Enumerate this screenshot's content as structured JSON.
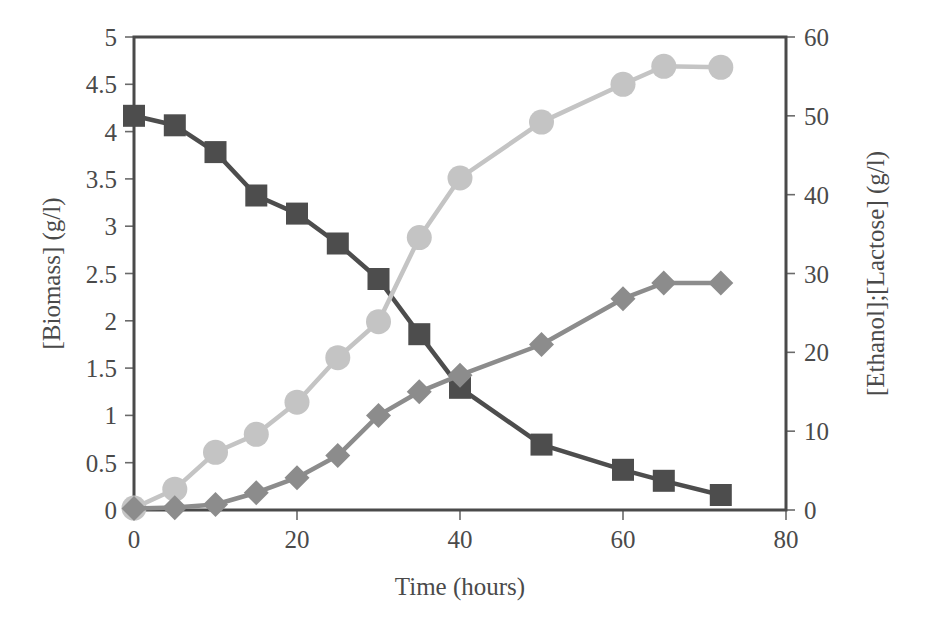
{
  "chart_data": {
    "type": "line",
    "title": "",
    "subtitle": "",
    "xlabel": "Time (hours)",
    "ylabel": "[Biomass] (g/l)",
    "y2label": "[Ethanol];[Lactose] (g/l)",
    "xlim": [
      0,
      80
    ],
    "xticks": [
      0,
      20,
      40,
      60,
      80
    ],
    "xticklabels": [
      "0",
      "20",
      "40",
      "60",
      "80"
    ],
    "ylim": [
      0,
      5
    ],
    "yticks": [
      0,
      0.5,
      1,
      1.5,
      2,
      2.5,
      3,
      3.5,
      4,
      4.5,
      5
    ],
    "yticklabels": [
      "0",
      "0.5",
      "1",
      "1.5",
      "2",
      "2.5",
      "3",
      "3.5",
      "4",
      "4.5",
      "5"
    ],
    "y2lim": [
      0,
      60
    ],
    "y2ticks": [
      0,
      10,
      20,
      30,
      40,
      50,
      60
    ],
    "y2ticklabels": [
      "0",
      "10",
      "20",
      "30",
      "40",
      "50",
      "60"
    ],
    "grid": false,
    "legend": "none",
    "x": [
      0,
      5,
      10,
      15,
      20,
      25,
      30,
      35,
      40,
      50,
      60,
      65,
      72
    ],
    "series": [
      {
        "name": "Lactose",
        "marker": "square",
        "color": "#4d4d4d",
        "axis": "right",
        "units": "g/l",
        "values": [
          50.0,
          48.8,
          45.4,
          39.9,
          37.6,
          33.8,
          29.3,
          22.3,
          15.5,
          8.3,
          5.1,
          3.7,
          1.9
        ],
        "values_left_scale": [
          4.18,
          4.07,
          3.78,
          3.33,
          3.13,
          2.82,
          2.44,
          1.86,
          1.29,
          0.69,
          0.43,
          0.31,
          0.16
        ]
      },
      {
        "name": "Biomass",
        "marker": "circle",
        "color": "#c4c4c4",
        "axis": "left",
        "units": "g/l",
        "values": [
          0.02,
          0.22,
          0.61,
          0.8,
          1.14,
          1.61,
          1.99,
          2.88,
          3.51,
          4.1,
          4.5,
          4.69,
          4.68
        ],
        "values_right_scale": [
          0.2,
          2.6,
          7.3,
          9.6,
          13.7,
          19.3,
          23.9,
          34.6,
          42.1,
          49.2,
          54.0,
          56.3,
          56.2
        ]
      },
      {
        "name": "Ethanol",
        "marker": "diamond",
        "color": "#8c8c8c",
        "axis": "right",
        "units": "g/l",
        "values": [
          0.2,
          0.3,
          0.7,
          2.2,
          4.1,
          6.9,
          12.0,
          15.0,
          17.1,
          21.0,
          26.8,
          28.8,
          28.8
        ],
        "values_left_scale": [
          0.02,
          0.03,
          0.06,
          0.18,
          0.34,
          0.58,
          1.0,
          1.25,
          1.43,
          1.75,
          2.23,
          2.4,
          2.4
        ]
      }
    ]
  },
  "style": {
    "axis_color": "#4a4a4a",
    "tick_color": "#6a6a6a",
    "text_color": "#4a4a4a",
    "background": "#ffffff",
    "series_colors": [
      "#4d4d4d",
      "#c4c4c4",
      "#8c8c8c"
    ]
  }
}
